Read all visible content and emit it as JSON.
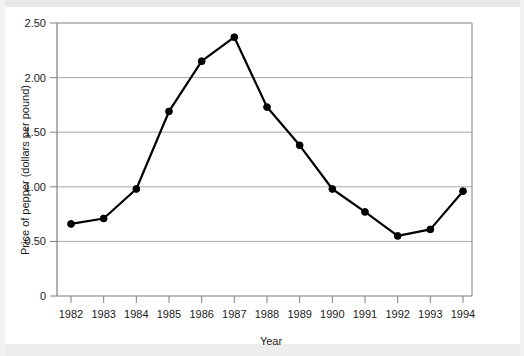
{
  "chart_data": {
    "type": "line",
    "title": "",
    "xlabel": "Year",
    "ylabel": "Price of pepper (dollars per pound)",
    "categories": [
      1982,
      1983,
      1984,
      1985,
      1986,
      1987,
      1988,
      1989,
      1990,
      1991,
      1992,
      1993,
      1994
    ],
    "values": [
      0.66,
      0.71,
      0.98,
      1.69,
      2.15,
      2.37,
      1.73,
      1.38,
      0.98,
      0.77,
      0.55,
      0.61,
      0.96
    ],
    "series": [
      {
        "name": "Price of pepper",
        "values": [
          0.66,
          0.71,
          0.98,
          1.69,
          2.15,
          2.37,
          1.73,
          1.38,
          0.98,
          0.77,
          0.55,
          0.61,
          0.96
        ]
      }
    ],
    "x_tick_labels": [
      "1982",
      "1983",
      "1984",
      "1985",
      "1986",
      "1987",
      "1988",
      "1989",
      "1990",
      "1991",
      "1992",
      "1993",
      "1994"
    ],
    "y_tick_labels": [
      "0",
      "0.50",
      "1.00",
      "1.50",
      "2.00",
      "2.50"
    ],
    "y_tick_values": [
      0,
      0.5,
      1.0,
      1.5,
      2.0,
      2.5
    ],
    "ylim": [
      0,
      2.5
    ],
    "xlim": [
      1982,
      1994
    ],
    "grid": "horizontal",
    "legend": "none",
    "line_color": "#000000",
    "marker": "circle",
    "marker_color": "#000000",
    "grid_color": "#a9a9a9",
    "axis_color": "#808080",
    "background": "#ffffff"
  },
  "axes": {
    "ylabel": "Price of pepper (dollars per pound)",
    "xlabel": "Year"
  }
}
